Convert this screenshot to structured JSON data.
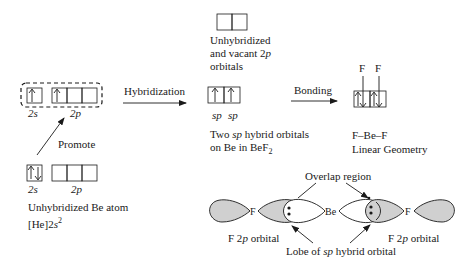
{
  "diagram": {
    "ground_state": {
      "label_line1": "Unhybridized Be atom",
      "label_line2_prefix": "[He]2",
      "label_line2_italic": "s",
      "label_line2_sup": "2",
      "sublevel_2s": "2s",
      "sublevel_2p": "2p",
      "orbitals_2s": [
        "up-down"
      ],
      "orbitals_2p": [
        "empty",
        "empty",
        "empty"
      ]
    },
    "promote_label": "Promote",
    "excited_state": {
      "sublevel_2s": "2s",
      "sublevel_2p": "2p",
      "orbitals_2s": [
        "up"
      ],
      "orbitals_2p": [
        "up",
        "empty",
        "empty"
      ]
    },
    "hybridization_label": "Hybridization",
    "vacant_p": {
      "line1": "Unhybridized",
      "line2_prefix": "and vacant 2",
      "line2_italic": "p",
      "line3": "orbitals",
      "orbitals": [
        "empty",
        "empty"
      ]
    },
    "sp_hybrids": {
      "labels": [
        "sp",
        "sp"
      ],
      "orbitals": [
        "up",
        "up"
      ],
      "caption_line1_prefix": "Two ",
      "caption_line1_italic": "sp",
      "caption_line1_suffix": " hybrid orbitals",
      "caption_line2_prefix": "on Be in BeF",
      "caption_line2_sub": "2"
    },
    "bonding_label": "Bonding",
    "bonded": {
      "f_labels": [
        "F",
        "F"
      ],
      "orbitals": [
        "up-down",
        "up-down"
      ],
      "formula": "F–Be–F",
      "geometry": "Linear Geometry"
    },
    "orbital_overlap": {
      "atoms": [
        "F",
        "Be",
        "F"
      ],
      "overlap_label": "Overlap region",
      "left_f_label_prefix": "F 2",
      "left_f_label_italic": "p",
      "left_f_label_suffix": " orbital",
      "right_f_label_prefix": "F 2",
      "right_f_label_italic": "p",
      "right_f_label_suffix": " orbital",
      "lobe_label_prefix": "Lobe of ",
      "lobe_label_italic": "sp",
      "lobe_label_suffix": " hybrid orbital"
    },
    "colors": {
      "line": "#1a1a1a",
      "f_lobe_fill": "#d0d0d0",
      "sp_lobe_fill": "#ffffff"
    }
  }
}
